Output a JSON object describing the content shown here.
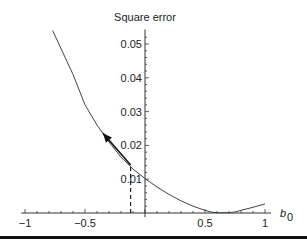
{
  "chart_data": {
    "type": "line",
    "title": "Square error",
    "xlabel": "b",
    "xlabel_subscript": "0",
    "ylabel": "Square error",
    "xlim": [
      -1.03,
      1.05
    ],
    "ylim": [
      0,
      0.054
    ],
    "x_ticks": [
      -1,
      -0.5,
      0.5,
      1
    ],
    "x_tick_labels": [
      "−1",
      "−0.5",
      "0.5",
      "1"
    ],
    "y_ticks": [
      0.01,
      0.02,
      0.03,
      0.04,
      0.05
    ],
    "y_tick_labels": [
      "0.01",
      "0.02",
      "0.03",
      "0.04",
      "0.05"
    ],
    "grid": false,
    "series": [
      {
        "name": "Square error curve",
        "x": [
          -0.77,
          -0.6,
          -0.5,
          -0.4,
          -0.3,
          -0.2,
          -0.1,
          0.0,
          0.1,
          0.2,
          0.3,
          0.4,
          0.5,
          0.55,
          0.6,
          0.7,
          0.75,
          0.8,
          0.9,
          1.0
        ],
        "y": [
          0.054,
          0.041,
          0.032,
          0.026,
          0.021,
          0.0165,
          0.013,
          0.0102,
          0.0077,
          0.0055,
          0.0036,
          0.002,
          0.0008,
          0.0003,
          0.0001,
          0.0001,
          0.0003,
          0.0008,
          0.0017,
          0.0027
        ]
      }
    ],
    "annotations": {
      "gradient_arrow": {
        "from": [
          -0.12,
          0.0142
        ],
        "to": [
          -0.35,
          0.0236
        ],
        "description": "arrow along curve pointing up-left"
      },
      "dashed_line": {
        "x": -0.12,
        "y_from": 0,
        "y_to": 0.0142
      }
    }
  }
}
